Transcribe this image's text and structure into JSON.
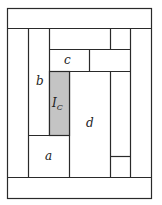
{
  "diagram": {
    "type": "log-cabin quilt block layout",
    "labels": {
      "a": "a",
      "b": "b",
      "c": "c",
      "d": "d",
      "center_main": "I",
      "center_sub": "C"
    },
    "colors": {
      "stroke": "#2a2a2a",
      "center_fill": "#c4c4c4",
      "background": "#ffffff"
    }
  }
}
